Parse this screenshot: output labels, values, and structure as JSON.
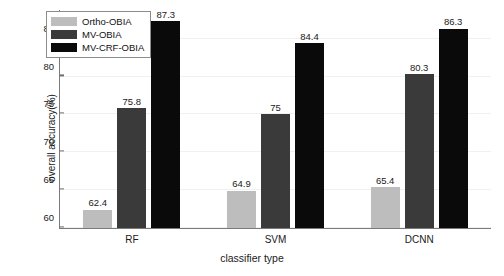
{
  "chart_data": {
    "type": "bar",
    "title": "",
    "xlabel": "classifier type",
    "ylabel": "overall accuracy(%)",
    "categories": [
      "RF",
      "SVM",
      "DCNN"
    ],
    "series": [
      {
        "name": "Ortho-OBIA",
        "color": "#bdbdbd",
        "values": [
          62.4,
          64.9,
          65.4
        ],
        "labels": [
          "62.4",
          "64.9",
          "65.4"
        ]
      },
      {
        "name": "MV-OBIA",
        "color": "#3a3a3a",
        "values": [
          75.8,
          75.0,
          80.3
        ],
        "labels": [
          "75.8",
          "75",
          "80.3"
        ]
      },
      {
        "name": "MV-CRF-OBIA",
        "color": "#0a0a0a",
        "values": [
          87.3,
          84.4,
          86.3
        ],
        "labels": [
          "87.3",
          "84.4",
          "86.3"
        ]
      }
    ],
    "ylim": [
      60,
      88.8
    ],
    "yticks": [
      60,
      65,
      70,
      75,
      80,
      85
    ],
    "ytick_labels": [
      "60",
      "65",
      "70",
      "75",
      "80",
      "85"
    ],
    "grid": true,
    "legend_position": "top-left"
  },
  "legend": {
    "items": [
      {
        "label": "Ortho-OBIA",
        "color": "#bdbdbd"
      },
      {
        "label": "MV-OBIA",
        "color": "#3a3a3a"
      },
      {
        "label": "MV-CRF-OBIA",
        "color": "#0a0a0a"
      }
    ]
  }
}
